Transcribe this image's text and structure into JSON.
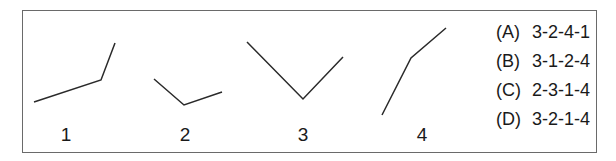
{
  "figures": [
    {
      "label": "1",
      "points": "34,102 101,80 115,43",
      "label_x": 66
    },
    {
      "label": "2",
      "points": "154,79 184,105 222,92",
      "label_x": 185
    },
    {
      "label": "3",
      "points": "247,42 303,99 343,57",
      "label_x": 303
    },
    {
      "label": "4",
      "points": "382,115 411,58 446,28",
      "label_x": 422
    }
  ],
  "options": [
    {
      "letter": "(A)",
      "value": "3-2-4-1"
    },
    {
      "letter": "(B)",
      "value": "3-1-2-4"
    },
    {
      "letter": "(C)",
      "value": "2-3-1-4"
    },
    {
      "letter": "(D)",
      "value": "3-2-1-4"
    }
  ],
  "colors": {
    "line": "#2a2a2a",
    "border": "#6a6a6a"
  }
}
